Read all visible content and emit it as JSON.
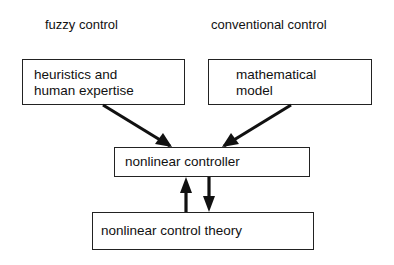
{
  "headings": {
    "left": "fuzzy control",
    "right": "conventional control"
  },
  "nodes": {
    "heuristics": "heuristics and\nhuman expertise",
    "math_model": "mathematical\nmodel",
    "controller": "nonlinear controller",
    "theory": "nonlinear control theory"
  },
  "edges": [
    {
      "from": "heuristics",
      "to": "controller"
    },
    {
      "from": "math_model",
      "to": "controller"
    },
    {
      "from": "theory",
      "to": "controller"
    },
    {
      "from": "controller",
      "to": "theory"
    }
  ]
}
